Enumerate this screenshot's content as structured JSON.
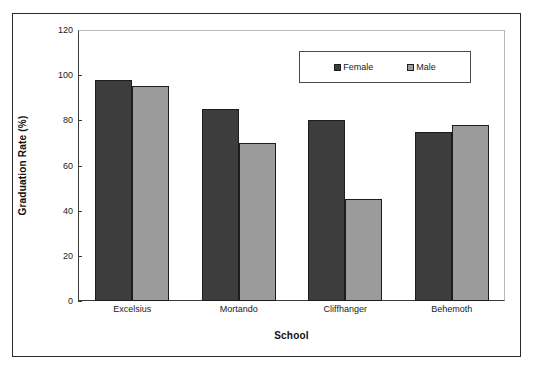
{
  "chart_data": {
    "type": "bar",
    "title": "",
    "subtitle": "",
    "xlabel": "School",
    "ylabel": "Graduation Rate (%)",
    "categories": [
      "Excelsius",
      "Mortando",
      "Cliffhanger",
      "Behemoth"
    ],
    "series": [
      {
        "name": "Female",
        "values": [
          98,
          85,
          80,
          75
        ],
        "color": "#3d3d3d"
      },
      {
        "name": "Male",
        "values": [
          95,
          70,
          45,
          78
        ],
        "color": "#9b9b9b"
      }
    ],
    "ylim": [
      0,
      120
    ],
    "yticks": [
      0,
      20,
      40,
      60,
      80,
      100,
      120
    ],
    "ytick_labels": [
      "0",
      "20",
      "40",
      "60",
      "80",
      "100",
      "120"
    ],
    "grid": false,
    "legend_position": "upper right",
    "bar_border_color": "#1d1d1d",
    "axis_color": "#3a3a3a",
    "frame_color": "#2b2b2b",
    "background": "#ffffff"
  }
}
